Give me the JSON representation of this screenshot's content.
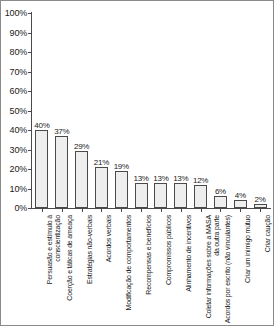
{
  "chart_data": {
    "type": "bar",
    "title": "",
    "xlabel": "",
    "ylabel": "",
    "ylim": [
      0,
      100
    ],
    "ytick_labels": [
      "100%",
      "90%",
      "80%",
      "70%",
      "60%",
      "50%",
      "40%",
      "30%",
      "20%",
      "10%",
      "0%"
    ],
    "ytick_values": [
      100,
      90,
      80,
      70,
      60,
      50,
      40,
      30,
      20,
      10,
      0
    ],
    "grid": false,
    "legend": null,
    "categories": [
      "Persuasão e estímulo à conscientização",
      "Coerção e táticas de ameaça",
      "Estratégias não-verbais",
      "Acordos verbais",
      "Modificação de comportamentos",
      "Recompensas e benefícios",
      "Compromissos públicos",
      "Alinhamento de incentivos",
      "Coletar informações sobre a MASA da outra parte",
      "Acordos por escrito (não vinculantes)",
      "Criar um inimigo mútuo",
      "Criar caução"
    ],
    "values": [
      40,
      37,
      29,
      21,
      19,
      13,
      13,
      13,
      12,
      6,
      4,
      2
    ],
    "value_labels": [
      "40%",
      "37%",
      "29%",
      "21%",
      "19%",
      "13%",
      "13%",
      "13%",
      "12%",
      "6%",
      "4%",
      "2%"
    ]
  },
  "style": {
    "bar_fill": "#eeeeee",
    "bar_stroke": "#4a4a4a",
    "axis_color": "#4a4a4a",
    "text_color": "#1a1a1a",
    "frame_color": "#8a8a8a",
    "background": "#ffffff"
  }
}
